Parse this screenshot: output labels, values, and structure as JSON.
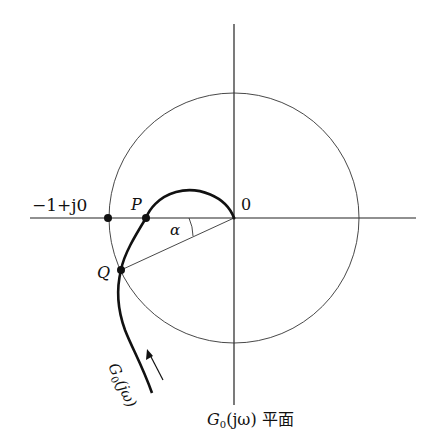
{
  "diagram": {
    "title_label": "G₀(jω) 平面",
    "title_main": "G",
    "title_sub": "0",
    "title_rest": "(jω) 平面",
    "labels": {
      "critical_point": "−1+j0",
      "origin": "0",
      "point_p": "P",
      "point_q": "Q",
      "angle": "α",
      "curve_main": "G",
      "curve_sub": "0",
      "curve_rest": "(jω)"
    },
    "elements": [
      "real-axis",
      "imaginary-axis",
      "unit-circle",
      "nyquist-curve",
      "radius-line-OQ",
      "angle-arc",
      "direction-arrow"
    ],
    "colors": {
      "ink": "#111111",
      "background": "#ffffff"
    }
  }
}
